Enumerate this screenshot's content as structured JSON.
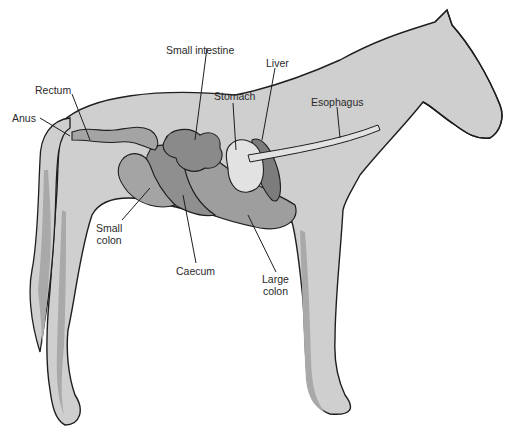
{
  "diagram": {
    "colors": {
      "body_fill": "#cfcfcf",
      "body_shadow": "#a9a9a9",
      "organ_fill": "#9e9e9e",
      "organ_dark": "#7c7c7c",
      "stomach_fill": "#e2e2e2",
      "outline": "#1e1e1e",
      "label_text": "#2a2a2a"
    },
    "labels": {
      "small_intestine": "Small intestine",
      "liver": "Liver",
      "stomach": "Stomach",
      "esophagus": "Esophagus",
      "rectum": "Rectum",
      "anus": "Anus",
      "small_colon_line1": "Small",
      "small_colon_line2": "colon",
      "caecum": "Caecum",
      "large_colon_line1": "Large",
      "large_colon_line2": "colon"
    }
  }
}
